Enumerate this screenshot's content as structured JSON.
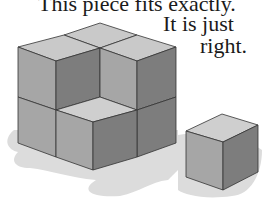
{
  "caption": {
    "line1": "This piece fits exactly.",
    "line2": "It is just",
    "line3": "right."
  },
  "illustration": {
    "subject": "2x2x2 cube stack with one missing cube, and the missing cube placed beside it",
    "colors": {
      "top_face": "#c9c9c9",
      "left_face": "#a6a6a6",
      "right_face": "#7d7d7d",
      "shadow": "#d8d8d8",
      "edge": "#333333"
    }
  }
}
